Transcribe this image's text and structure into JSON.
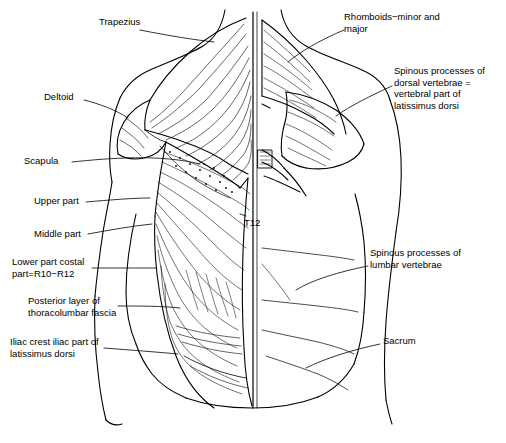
{
  "figure": {
    "title": "",
    "type": "anatomical-line-drawing",
    "labels": [
      {
        "id": "trapezius",
        "text": "Trapezius",
        "x": 99,
        "y": 22,
        "align": "left"
      },
      {
        "id": "rhomboids",
        "text": "Rhomboids−minor and\nmajor",
        "x": 344,
        "y": 16,
        "align": "left"
      },
      {
        "id": "spinous-dorsal",
        "text": "Spinous processes of\ndorsal vertebrae =\nvertebral part of\nlatissimus dorsi",
        "x": 394,
        "y": 70,
        "align": "left"
      },
      {
        "id": "deltoid",
        "text": "Deltoid",
        "x": 44,
        "y": 96,
        "align": "left"
      },
      {
        "id": "scapula",
        "text": "Scapula",
        "x": 24,
        "y": 160,
        "align": "left"
      },
      {
        "id": "upper-part",
        "text": "Upper part",
        "x": 34,
        "y": 200,
        "align": "left"
      },
      {
        "id": "middle-part",
        "text": "Middle part",
        "x": 34,
        "y": 233,
        "align": "left"
      },
      {
        "id": "t12",
        "text": "T12",
        "x": 243,
        "y": 222,
        "align": "left"
      },
      {
        "id": "lower-part-costal",
        "text": "Lower part costal\npart=R10−R12",
        "x": 12,
        "y": 262,
        "align": "left"
      },
      {
        "id": "spinous-lumbar",
        "text": "Spinous processes of\nlumbar vertebrae",
        "x": 370,
        "y": 252,
        "align": "left"
      },
      {
        "id": "posterior-layer",
        "text": "Posterior layer of\nthoracolumbar fascia",
        "x": 28,
        "y": 300,
        "align": "left"
      },
      {
        "id": "iliac-crest",
        "text": "Iliac crest iliac part of\nlatissimus dorsi",
        "x": 10,
        "y": 341,
        "align": "left"
      },
      {
        "id": "sacrum",
        "text": "Sacrum",
        "x": 383,
        "y": 340,
        "align": "left"
      }
    ],
    "colors": {
      "ink": "#000000",
      "background": "#ffffff"
    }
  }
}
